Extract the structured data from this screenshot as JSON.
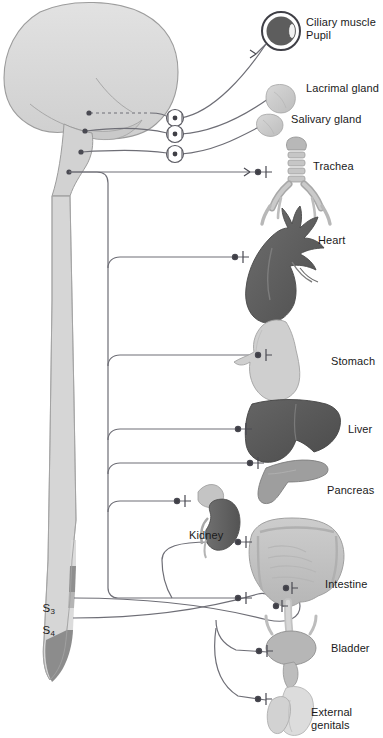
{
  "figure": {
    "type": "anatomical-diagram",
    "background_color": "#ffffff"
  },
  "palette": {
    "brain": "#d8d8d8",
    "brain_stroke": "#9a9a9a",
    "cord_light": "#d9d9d9",
    "cord_mid": "#b0b0b0",
    "cord_dark": "#8a8a8a",
    "nerve": "#6e6e76",
    "organ_light": "#cfcfcf",
    "organ_mid": "#a8a8a8",
    "organ_dark": "#6d6d6d",
    "heart": "#5f5f5f",
    "liver": "#575757",
    "eye_iris": "#5a5a5a",
    "text": "#1a1a1a"
  },
  "labels": [
    {
      "id": "ciliary-muscle",
      "text": "Ciliary muscle",
      "x": 306,
      "y": 22
    },
    {
      "id": "pupil",
      "text": "Pupil",
      "x": 306,
      "y": 35
    },
    {
      "id": "lacrimal-gland",
      "text": "Lacrimal gland",
      "x": 306,
      "y": 88
    },
    {
      "id": "salivary-gland",
      "text": "Salivary gland",
      "x": 291,
      "y": 119
    },
    {
      "id": "trachea",
      "text": "Trachea",
      "x": 313,
      "y": 166
    },
    {
      "id": "heart",
      "text": "Heart",
      "x": 318,
      "y": 240
    },
    {
      "id": "stomach",
      "text": "Stomach",
      "x": 331,
      "y": 361
    },
    {
      "id": "liver",
      "text": "Liver",
      "x": 348,
      "y": 429
    },
    {
      "id": "pancreas",
      "text": "Pancreas",
      "x": 327,
      "y": 490
    },
    {
      "id": "kidney",
      "text": "Kidney",
      "x": 189,
      "y": 535
    },
    {
      "id": "intestine",
      "text": "Intestine",
      "x": 325,
      "y": 584
    },
    {
      "id": "bladder",
      "text": "Bladder",
      "x": 331,
      "y": 648
    },
    {
      "id": "external",
      "text": "External",
      "x": 311,
      "y": 712
    },
    {
      "id": "genitals",
      "text": "genitals",
      "x": 311,
      "y": 725
    }
  ],
  "spinal_segments": [
    {
      "id": "s3",
      "letter": "S",
      "number": "3",
      "x": 36,
      "y": 595
    },
    {
      "id": "s4",
      "letter": "S",
      "number": "4",
      "x": 36,
      "y": 617
    }
  ],
  "organs": [
    {
      "id": "eye",
      "name": "eye-with-pupil"
    },
    {
      "id": "lacrimal-gland",
      "name": "lacrimal-gland"
    },
    {
      "id": "salivary-gland",
      "name": "salivary-gland"
    },
    {
      "id": "trachea",
      "name": "trachea-and-bronchi"
    },
    {
      "id": "heart",
      "name": "heart"
    },
    {
      "id": "stomach",
      "name": "stomach"
    },
    {
      "id": "liver",
      "name": "liver"
    },
    {
      "id": "pancreas",
      "name": "pancreas"
    },
    {
      "id": "kidney",
      "name": "kidney-with-adrenal"
    },
    {
      "id": "intestine",
      "name": "intestine"
    },
    {
      "id": "bladder",
      "name": "bladder"
    },
    {
      "id": "external-genitals",
      "name": "external-genitals"
    }
  ],
  "ganglia_circles": [
    {
      "id": "ciliary-ganglion",
      "cx": 175,
      "cy": 118
    },
    {
      "id": "pterygopalatine-ganglion",
      "cx": 175,
      "cy": 134
    },
    {
      "id": "submandibular-ganglion",
      "cx": 175,
      "cy": 154
    }
  ],
  "outflow": {
    "cranial_origin": "brainstem",
    "sacral_origin": "S3-S4 spinal cord segments"
  }
}
